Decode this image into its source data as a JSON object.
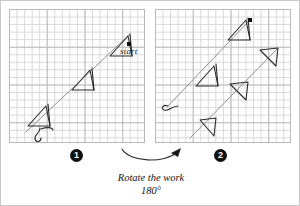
{
  "figure": {
    "grid": {
      "cell_px": 7.55,
      "major_every": 5,
      "minor_color": "#d8d8d8",
      "major_color": "#bdbdbd"
    },
    "panels": [
      {
        "id": "panel-1",
        "badge": "1",
        "label": "start",
        "description": "Graph paper panel showing a long diagonal zigzag line running from lower-left to upper-right with three arrowhead/triangle chevrons and a wavy tail at the lower left; a black square marks the start point at the upper right."
      },
      {
        "id": "panel-2",
        "badge": "2",
        "label": "",
        "description": "Same work rotated 180 degrees: the diagonal zigzag line with chevrons now reads with the wavy tail at mid-left and chevrons mirrored."
      }
    ],
    "caption_line1": "Rotate the work",
    "caption_line2": "180°",
    "arrow": {
      "name": "curved-rotate-arrow",
      "direction": "left-to-right"
    },
    "colors": {
      "ink": "#1a1a1a",
      "badge_bg": "#111111",
      "badge_fg": "#ffffff",
      "panel_border": "#b9b9b9"
    }
  }
}
